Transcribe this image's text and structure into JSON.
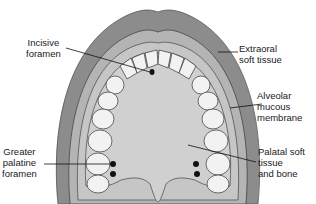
{
  "diagram": {
    "labels": {
      "incisive_foramen": [
        "Incisive",
        "foramen"
      ],
      "extraoral_soft_tissue": [
        "Extraoral",
        "soft tissue"
      ],
      "alveolar_mucous_membrane": [
        "Alveolar",
        "mucous",
        "membrane"
      ],
      "greater_palatine_foramen": [
        "Greater",
        "palatine",
        "foramen"
      ],
      "palatal_soft_tissue": [
        "Palatal soft",
        "tissue",
        "and bone"
      ]
    },
    "colors": {
      "outer_tissue": "#8c8c8c",
      "mid_tissue": "#b4b4b4",
      "inner_mucosa": "#c8c8c8",
      "palate": "#d0d0d0",
      "tooth": "#f2f2f2",
      "outline": "#333333"
    }
  }
}
